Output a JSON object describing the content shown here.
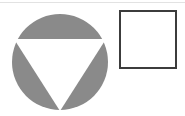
{
  "canvas": {
    "width": 185,
    "height": 116,
    "background_color": "#ffffff",
    "description": "Black and white scanned line drawing of two geometric shapes"
  },
  "artifact": {
    "name": "scan-line",
    "color": "#e2e2e2",
    "y": 2,
    "height": 1
  },
  "shapes": [
    {
      "id": "circle-with-inverted-triangle",
      "label": "Gray circle containing white downward-pointing triangle",
      "type": "compound",
      "fill_color": "#8a8a8a",
      "circle": {
        "center_x": 60,
        "center_y": 62,
        "radius": 48
      },
      "triangle": {
        "orientation": "down",
        "fill_color": "#ffffff",
        "points": [
          {
            "x": 14,
            "y": 39
          },
          {
            "x": 106,
            "y": 39
          },
          {
            "x": 60,
            "y": 111
          }
        ]
      }
    },
    {
      "id": "empty-square",
      "label": "Empty square outline",
      "type": "rectangle",
      "fill_color": "#ffffff",
      "stroke_color": "#3c3c3c",
      "stroke_width": 2,
      "x": 119,
      "y": 10,
      "width": 58,
      "height": 59
    }
  ]
}
